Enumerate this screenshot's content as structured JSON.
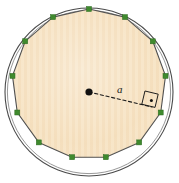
{
  "figure": {
    "type": "geometry-diagram",
    "labels": {
      "apothem": "a"
    },
    "colors": {
      "fill": "#f6e2c2",
      "stroke": "#4a4a4a",
      "vertex": "#3f8a2e",
      "center_dot": "#111111",
      "label_text": "#1a1a1a",
      "background": "#ffffff",
      "stripe": "#f1d8b4"
    },
    "geometry": {
      "center_x": 89,
      "center_y": 92,
      "circle_radius": 84,
      "polygon_sides": 14,
      "polygon_radius": 83,
      "rotation_degrees": -90,
      "apothem_length": 81,
      "apothem_angle_degrees": 13,
      "center_dot_radius": 3.6,
      "vertex_marker_size": 5,
      "right_angle_box_size": 13
    },
    "label_positions": {
      "apothem_label_left": 117,
      "apothem_label_top": 84
    }
  }
}
